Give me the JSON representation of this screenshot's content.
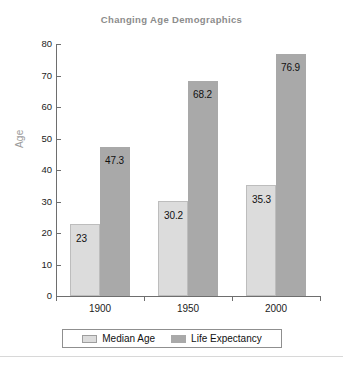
{
  "chart_data": {
    "type": "bar",
    "title": "Changing Age Demographics",
    "xlabel": "",
    "ylabel": "Age",
    "categories": [
      "1900",
      "1950",
      "2000"
    ],
    "series": [
      {
        "name": "Median Age",
        "color": "#dcdcdc",
        "values": [
          23,
          30.2,
          35.3
        ],
        "value_labels": [
          "23",
          "30.2",
          "35.3"
        ]
      },
      {
        "name": "Life Expectancy",
        "color": "#a9a9a9",
        "values": [
          47.3,
          68.2,
          76.9
        ],
        "value_labels": [
          "47.3",
          "68.2",
          "76.9"
        ]
      }
    ],
    "ylim": [
      0,
      80
    ],
    "ytick_values": [
      0,
      10,
      20,
      30,
      40,
      50,
      60,
      70,
      80
    ],
    "ytick_labels": [
      "0",
      "10",
      "20",
      "30",
      "40",
      "50",
      "60",
      "70",
      "80"
    ],
    "grid": false,
    "legend_position": "bottom",
    "title_color": "#8c8c8c",
    "axis_label_color": "#9a9a9a"
  }
}
